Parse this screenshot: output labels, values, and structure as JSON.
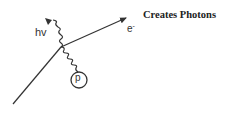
{
  "diagram": {
    "title": "Creates Photons",
    "labels": {
      "photon": "hv",
      "electron": "e",
      "electron_charge": "-",
      "particle": "p"
    },
    "elements": [
      {
        "type": "line",
        "role": "incoming-particle-track",
        "from": [
          13,
          104
        ],
        "to": [
          61,
          47
        ]
      },
      {
        "type": "arrow",
        "role": "outgoing-electron",
        "from": [
          61,
          47
        ],
        "to": [
          127,
          18
        ],
        "label": "e-"
      },
      {
        "type": "wavy-arrow",
        "role": "emitted-photon",
        "from": [
          61,
          47
        ],
        "to": [
          48,
          20
        ],
        "label": "hv"
      },
      {
        "type": "wavy-line",
        "role": "exchange-line",
        "from": [
          61,
          47
        ],
        "to": [
          76,
          72
        ]
      },
      {
        "type": "circle",
        "role": "particle-p",
        "center": [
          79,
          80
        ],
        "radius": 8,
        "label": "p"
      }
    ],
    "colors": {
      "stroke": "#333333",
      "text": "#222222",
      "background": "#ffffff"
    }
  }
}
